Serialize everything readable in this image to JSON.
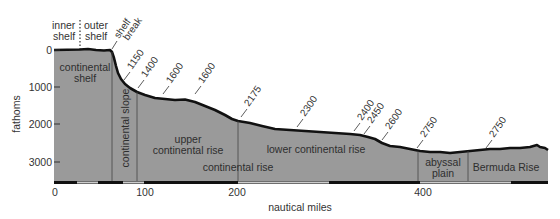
{
  "figure": {
    "y_axis": {
      "label": "fathoms",
      "ticks": [
        "0",
        "1000",
        "2000",
        "3000"
      ]
    },
    "x_axis": {
      "label": "nautical miles",
      "ticks": [
        "0",
        "100",
        "200",
        "400"
      ]
    },
    "top_labels": {
      "inner_shelf_line1": "inner",
      "inner_shelf_line2": "shelf",
      "outer_shelf_line1": "outer",
      "outer_shelf_line2": "shelf",
      "shelf_break_line1": "shelf",
      "shelf_break_line2": "break"
    },
    "regions": {
      "continental_shelf_line1": "continental",
      "continental_shelf_line2": "shelf",
      "continental_slope": "continental slope",
      "upper_rise_line1": "upper",
      "upper_rise_line2": "continental rise",
      "lower_rise": "lower continental rise",
      "continental_rise": "continental rise",
      "abyssal_plain_line1": "abyssal",
      "abyssal_plain_line2": "plain",
      "bermuda_rise": "Bermuda Rise"
    },
    "depth_markers": [
      "1150",
      "1400",
      "1600",
      "1600",
      "2175",
      "2300",
      "2400",
      "2450",
      "2600",
      "2750",
      "2750"
    ],
    "colors": {
      "seafloor_fill": "#9a9a9a",
      "profile_line": "#111111",
      "divider": "#444444",
      "text": "#333333"
    }
  }
}
